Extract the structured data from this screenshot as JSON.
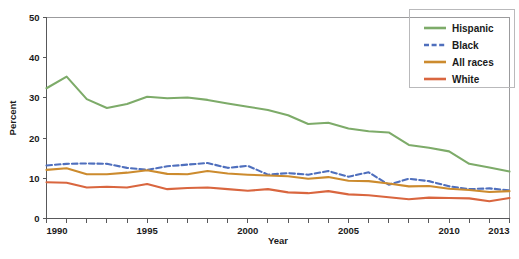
{
  "chart_data": {
    "type": "line",
    "title": "",
    "xlabel": "Year",
    "ylabel": "Percent",
    "xlim": [
      1990,
      2013
    ],
    "ylim": [
      0,
      50
    ],
    "yticks": [
      0,
      10,
      20,
      30,
      40,
      50
    ],
    "xticks_labeled": [
      1990,
      1995,
      2000,
      2005,
      2010,
      2013
    ],
    "x": [
      1990,
      1991,
      1992,
      1993,
      1994,
      1995,
      1996,
      1997,
      1998,
      1999,
      2000,
      2001,
      2002,
      2003,
      2004,
      2005,
      2006,
      2007,
      2008,
      2009,
      2010,
      2011,
      2012,
      2013
    ],
    "grid": false,
    "legend_position": "top-right",
    "series": [
      {
        "name": "Hispanic",
        "color": "#7dab69",
        "style": "solid",
        "values": [
          32.4,
          35.3,
          29.7,
          27.5,
          28.5,
          30.3,
          29.9,
          30.1,
          29.5,
          28.6,
          27.8,
          27.0,
          25.7,
          23.5,
          23.8,
          22.4,
          21.7,
          21.4,
          18.3,
          17.6,
          16.7,
          13.6,
          12.7,
          11.7
        ]
      },
      {
        "name": "Black",
        "color": "#4f6fbd",
        "style": "dashed",
        "values": [
          13.2,
          13.6,
          13.7,
          13.6,
          12.6,
          12.1,
          13.0,
          13.4,
          13.8,
          12.6,
          13.1,
          10.9,
          11.3,
          10.9,
          11.8,
          10.4,
          11.5,
          8.4,
          9.9,
          9.3,
          8.0,
          7.3,
          7.5,
          7.0
        ]
      },
      {
        "name": "All races",
        "color": "#cc8b2e",
        "style": "solid",
        "values": [
          12.1,
          12.5,
          11.0,
          11.0,
          11.4,
          12.0,
          11.1,
          11.0,
          11.8,
          11.2,
          10.9,
          10.7,
          10.5,
          9.9,
          10.3,
          9.4,
          9.3,
          8.7,
          8.0,
          8.1,
          7.4,
          7.1,
          6.6,
          6.8
        ]
      },
      {
        "name": "White",
        "color": "#d9663f",
        "style": "solid",
        "values": [
          9.0,
          8.9,
          7.7,
          7.9,
          7.7,
          8.6,
          7.3,
          7.6,
          7.7,
          7.3,
          6.9,
          7.3,
          6.5,
          6.3,
          6.8,
          6.0,
          5.8,
          5.3,
          4.8,
          5.2,
          5.1,
          5.0,
          4.3,
          5.1
        ]
      }
    ]
  },
  "axis": {
    "y_label": "Percent",
    "x_label": "Year",
    "y_tick_labels": [
      "0",
      "10",
      "20",
      "30",
      "40",
      "50"
    ],
    "x_tick_labels": [
      "1990",
      "1995",
      "2000",
      "2005",
      "2010",
      "2013"
    ]
  },
  "legend": {
    "items": [
      {
        "label": "Hispanic",
        "color": "#7dab69",
        "style": "solid"
      },
      {
        "label": "Black",
        "color": "#4f6fbd",
        "style": "dashed"
      },
      {
        "label": "All races",
        "color": "#cc8b2e",
        "style": "solid"
      },
      {
        "label": "White",
        "color": "#d9663f",
        "style": "solid"
      }
    ]
  }
}
